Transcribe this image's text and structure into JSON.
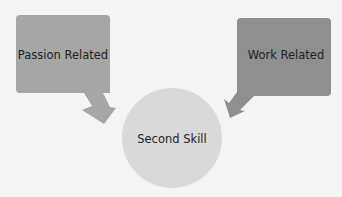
{
  "diagram": {
    "nodes": [
      {
        "id": "passion",
        "label": "Passion Related",
        "shape": "callout-rectangle",
        "color": "#a6a6a6"
      },
      {
        "id": "work",
        "label": "Work Related",
        "shape": "callout-rectangle",
        "color": "#8f8f8f"
      },
      {
        "id": "second",
        "label": "Second Skill",
        "shape": "circle",
        "color": "#d9d9d9"
      }
    ],
    "edges": [
      {
        "from": "passion",
        "to": "second"
      },
      {
        "from": "work",
        "to": "second"
      }
    ],
    "background": "#f4f4f4"
  }
}
